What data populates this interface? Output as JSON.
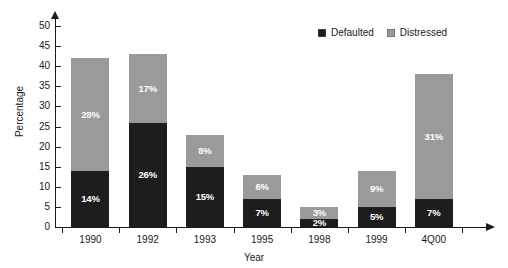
{
  "chart_data": {
    "type": "bar",
    "stacked": true,
    "title": "",
    "xlabel": "Year",
    "ylabel": "Percentage",
    "categories": [
      "1990",
      "1992",
      "1993",
      "1995",
      "1998",
      "1999",
      "4Q00"
    ],
    "series": [
      {
        "name": "Defaulted",
        "color": "#1d1d1d",
        "values": [
          14,
          26,
          15,
          7,
          2,
          5,
          7
        ],
        "labels": [
          "14%",
          "26%",
          "15%",
          "7%",
          "2%",
          "5%",
          "7%"
        ]
      },
      {
        "name": "Distressed",
        "color": "#9a9a9a",
        "values": [
          28,
          17,
          8,
          6,
          3,
          9,
          31
        ],
        "labels": [
          "28%",
          "17%",
          "8%",
          "6%",
          "3%",
          "9%",
          "31%"
        ]
      }
    ],
    "totals": [
      42,
      43,
      23,
      13,
      5,
      14,
      38
    ],
    "ylim": [
      0,
      52
    ],
    "yticks": [
      0,
      5,
      10,
      15,
      20,
      25,
      30,
      35,
      40,
      45,
      50
    ],
    "ytick_labels": [
      "0",
      "5",
      "10",
      "15",
      "20",
      "25",
      "30",
      "35",
      "40",
      "45",
      "50"
    ],
    "grid": false,
    "legend_position": "top-right",
    "legend_entries": [
      "Defaulted",
      "Distressed"
    ],
    "axis_arrows": true
  },
  "legend": {
    "defaulted_label": "Defaulted",
    "distressed_label": "Distressed"
  },
  "axes": {
    "y_title": "Percentage",
    "x_title": "Year"
  }
}
